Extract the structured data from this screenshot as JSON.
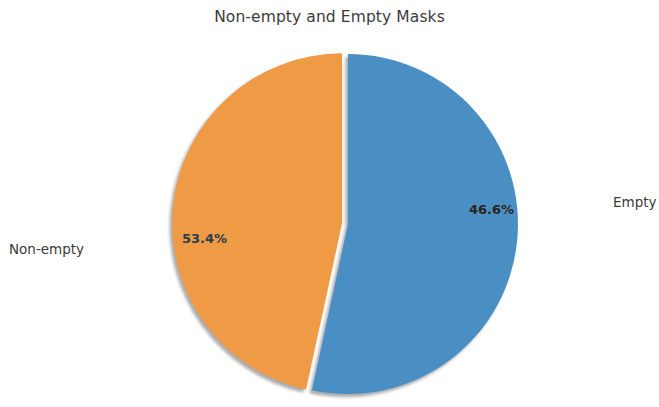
{
  "chart": {
    "title": "Non-empty and Empty Masks"
  },
  "chart_data": {
    "type": "pie",
    "title": "Non-empty and Empty Masks",
    "xlabel": "",
    "ylabel": "",
    "categories": [
      "Non-empty",
      "Empty"
    ],
    "values": [
      53.4,
      46.6
    ],
    "value_unit": "percent",
    "labels": [
      "Non-empty",
      "Empty"
    ],
    "percent_labels": [
      "53.4%",
      "46.6%"
    ],
    "colors": [
      "#4a8fc4",
      "#ef9a45"
    ],
    "legend": "none",
    "grid": false,
    "explode": [
      0.0,
      0.035
    ],
    "startangle": 90,
    "counterclock": false,
    "shadow": true,
    "slices": [
      {
        "name": "Non-empty",
        "value": 53.4,
        "percent_label": "53.4%",
        "color": "#4a8fc4",
        "outside_label": "Non-empty",
        "exploded": false
      },
      {
        "name": "Empty",
        "value": 46.6,
        "percent_label": "46.6%",
        "color": "#ef9a45",
        "outside_label": "Empty",
        "exploded": true
      }
    ]
  },
  "labels": {
    "nonempty_outside": "Non-empty",
    "empty_outside": "Empty",
    "nonempty_pct": "53.4%",
    "empty_pct": "46.6%"
  },
  "colors": {
    "slice_nonempty": "#4a8fc4",
    "slice_empty": "#ef9a45",
    "text": "#3b3b3b",
    "shadow": "#9a9a9a",
    "background": "#ffffff"
  }
}
